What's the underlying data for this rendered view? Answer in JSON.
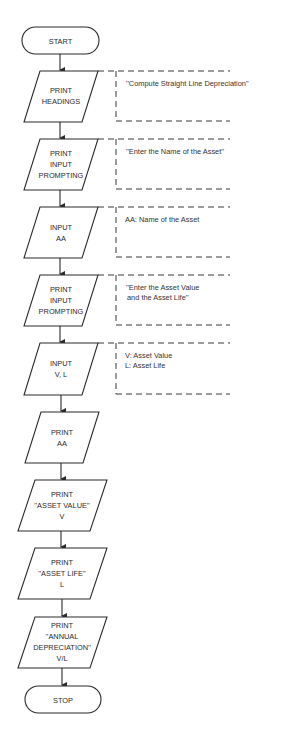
{
  "diagram": {
    "type": "flowchart",
    "colors": {
      "line": "#2b2b2b",
      "background": "#ffffff",
      "text": "#2b2b2b"
    },
    "nodes": [
      {
        "id": "start",
        "shape": "terminator",
        "lines": [
          "START"
        ]
      },
      {
        "id": "print-headings",
        "shape": "io",
        "lines": [
          "PRINT",
          "HEADINGS"
        ]
      },
      {
        "id": "print-prompt-name",
        "shape": "io",
        "lines": [
          "PRINT",
          "INPUT",
          "PROMPTING"
        ]
      },
      {
        "id": "input-aa",
        "shape": "io",
        "lines": [
          "INPUT",
          "AA"
        ]
      },
      {
        "id": "print-prompt-value-life",
        "shape": "io",
        "lines": [
          "PRINT",
          "INPUT",
          "PROMPTING"
        ]
      },
      {
        "id": "input-vl",
        "shape": "io",
        "lines": [
          "INPUT",
          "V, L"
        ]
      },
      {
        "id": "print-aa",
        "shape": "io",
        "lines": [
          "PRINT",
          "AA"
        ]
      },
      {
        "id": "print-asset-value",
        "shape": "io",
        "lines": [
          "PRINT",
          "''ASSET VALUE''",
          "V"
        ]
      },
      {
        "id": "print-asset-life",
        "shape": "io",
        "lines": [
          "PRINT",
          "''ASSET LIFE''",
          "L"
        ]
      },
      {
        "id": "print-annual-dep",
        "shape": "io",
        "lines": [
          "PRINT",
          "''ANNUAL",
          "DEPRECIATION''",
          "V/L"
        ]
      },
      {
        "id": "stop",
        "shape": "terminator",
        "lines": [
          "STOP"
        ]
      }
    ],
    "annotations": [
      {
        "attached_to": "print-headings",
        "lines": [
          "''Compute Straight Line Depreciation''"
        ]
      },
      {
        "attached_to": "print-prompt-name",
        "lines": [
          "''Enter the Name of the Asset''"
        ]
      },
      {
        "attached_to": "input-aa",
        "lines": [
          "AA:  Name of the Asset"
        ]
      },
      {
        "attached_to": "print-prompt-value-life",
        "lines": [
          "''Enter the Asset Value",
          " and the Asset Life''"
        ]
      },
      {
        "attached_to": "input-vl",
        "lines": [
          "V:  Asset Value",
          "L:  Asset Life"
        ]
      }
    ]
  }
}
